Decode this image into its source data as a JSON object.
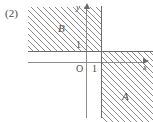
{
  "figure": {
    "number_label": "(2)",
    "axes": {
      "x_name": "x",
      "y_name": "y",
      "origin_label": "O",
      "x_tick_label": "1",
      "y_tick_label": "1"
    },
    "regions": [
      {
        "id": "B",
        "label": "B",
        "location": "upper-left",
        "hatched": true
      },
      {
        "id": "A",
        "label": "A",
        "location": "lower-right",
        "hatched": true
      }
    ]
  },
  "chart_data": {
    "type": "scatter",
    "title": "(2)",
    "xlabel": "x",
    "ylabel": "y",
    "xlim": [
      -2.8,
      3.3
    ],
    "ylim": [
      -2.5,
      2.4
    ],
    "grid": false,
    "annotations": [
      {
        "text": "B",
        "x": -1.05,
        "y": 1.55
      },
      {
        "text": "A",
        "x": 1.95,
        "y": -1.35
      },
      {
        "text": "O",
        "x": -0.35,
        "y": -0.2
      },
      {
        "text": "1",
        "x": 0.45,
        "y": -0.2
      },
      {
        "text": "1",
        "x": -0.35,
        "y": 0.85
      }
    ],
    "reference_lines": [
      {
        "orientation": "vertical",
        "value": 1,
        "label": "x = 1"
      },
      {
        "orientation": "horizontal",
        "value": 1,
        "label": "y = 1"
      }
    ],
    "shaded_regions": [
      {
        "name": "B",
        "description": "x < 1 and y > 1",
        "pattern": "diagonal-hatch-45"
      },
      {
        "name": "A",
        "description": "x > 1 and y < 1",
        "pattern": "diagonal-hatch-45"
      }
    ]
  }
}
